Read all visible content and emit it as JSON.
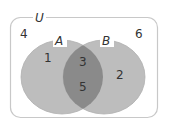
{
  "diagram": {
    "type": "venn",
    "universe": {
      "label": "U",
      "outside_value": [
        "4",
        "6"
      ]
    },
    "sets": [
      {
        "name": "A",
        "label": "A",
        "only_values": [
          "1"
        ]
      },
      {
        "name": "B",
        "label": "B",
        "only_values": [
          "2"
        ]
      }
    ],
    "intersection": {
      "values": [
        "3",
        "5"
      ]
    },
    "regions": {
      "outside_left": "4",
      "outside_right": "6",
      "a_only": "1",
      "b_only": "2",
      "a_and_b_top": "3",
      "a_and_b_bottom": "5"
    },
    "colors": {
      "circle_fill": "#bdbdbd",
      "intersection_fill": "#8a8a8a",
      "frame_stroke": "#c8c8c8",
      "text": "#333333",
      "background": "#ffffff"
    }
  }
}
